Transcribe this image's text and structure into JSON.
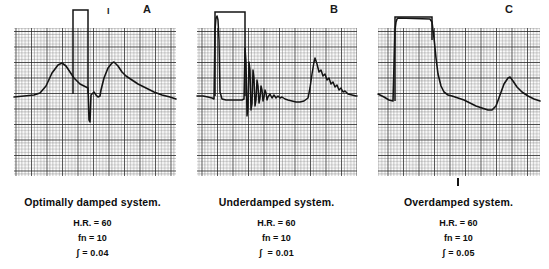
{
  "figure": {
    "background": "#ffffff",
    "ink_color": "#1a1a1a"
  },
  "panels": [
    {
      "letter": "A",
      "tick_label": "I",
      "tick_position": "top",
      "caption": "Optimally damped system.",
      "params": [
        "H.R. = 60",
        "fn = 10",
        "ʃ = 0.04"
      ],
      "param_labels": [
        "H.R.",
        "fn",
        "ʃ"
      ],
      "param_values": [
        "60",
        "10",
        "0.04"
      ],
      "grid": {
        "x": 14,
        "y": 28,
        "width": 162,
        "height": 148,
        "fine_step": 3.1,
        "coarse_step": 15.5,
        "fine_color": "#6e6e6e",
        "coarse_color": "#2b2b2b"
      }
    },
    {
      "letter": "B",
      "tick_label": "",
      "tick_position": "none",
      "caption": "Underdamped system.",
      "params": [
        "H.R. = 60",
        "fn = 10",
        "ʃ  = 0.01"
      ],
      "param_labels": [
        "H.R.",
        "fn",
        "ʃ"
      ],
      "param_values": [
        "60",
        "10",
        "0.01"
      ],
      "grid": {
        "x": 12,
        "y": 28,
        "width": 160,
        "height": 148,
        "fine_step": 3.1,
        "coarse_step": 15.5,
        "fine_color": "#6e6e6e",
        "coarse_color": "#2b2b2b"
      }
    },
    {
      "letter": "C",
      "tick_label": "I",
      "tick_position": "bottom",
      "caption": "Overdamped system.",
      "params": [
        "H.R. = 60",
        "fn = 10",
        "ʃ = 0.05"
      ],
      "param_labels": [
        "H.R.",
        "fn",
        "ʃ"
      ],
      "param_values": [
        "60",
        "10",
        "0.05"
      ],
      "grid": {
        "x": 10,
        "y": 28,
        "width": 162,
        "height": 148,
        "fine_step": 3.1,
        "coarse_step": 15.5,
        "fine_color": "#6e6e6e",
        "coarse_color": "#2b2b2b"
      }
    }
  ],
  "chart_data": {
    "type": "line",
    "xlabel": "",
    "ylabel": "",
    "grid": true,
    "legend": "none",
    "series": [
      {
        "name": "A — Optimally damped system",
        "heart_rate_bpm": 60,
        "natural_frequency_hz": 10,
        "damping_coefficient": 0.04,
        "square_wave": {
          "rise_x": 73,
          "fall_x": 88,
          "top_y": 10,
          "baseline_y": 94
        },
        "trace_points": "14,97 24,96 34,95 40,93 46,86 52,73 58,65 62,63 66,66 70,72 74,78 78,82 80,84 84,86 88,88 89,120 90,122 91,95 94,92 96,95 98,97 100,96 101,90 104,78 108,68 112,63 114,62 118,66 122,72 126,76 132,80 138,84 146,88 154,92 162,95 170,97 176,99"
      },
      {
        "name": "B — Underdamped system",
        "heart_rate_bpm": 60,
        "natural_frequency_hz": 10,
        "damping_coefficient": 0.01,
        "square_wave": {
          "rise_x": 215,
          "fall_x": 245,
          "top_y": 12,
          "baseline_y": 96
        },
        "trace_points": "197,96 203,96 208,97 212,98 214,99 215,30 216,18 217,16 218,20 219,40 220,92 222,99 226,100 230,100 234,100 238,100 242,100 244,99 245,48 246,62 247,116 248,108 249,62 250,70 251,110 252,104 253,70 254,78 255,106 256,100 257,80 258,86 259,103 260,98 261,86 262,90 263,101 264,97 265,90 266,93 267,100 268,97 270,94 272,98 274,95 276,98 278,96 280,98 282,97 285,99 288,100 292,101 296,102 300,102 304,101 308,98 310,88 312,74 314,62 315,58 317,64 319,72 321,70 323,76 325,74 327,80 329,78 331,84 333,82 335,87 337,85 339,90 341,88 343,92 345,91 348,94 352,95 356,96 357,96"
      },
      {
        "name": "C — Overdamped system",
        "heart_rate_bpm": 60,
        "natural_frequency_hz": 10,
        "damping_coefficient": 0.05,
        "square_wave": {
          "rise_x": 395,
          "fall_x": 432,
          "top_y": 17,
          "baseline_y": 101
        },
        "trace_points": "378,94 384,97 389,100 393,101 395,30 396,22 397,19 398,18 430,19 432,22 434,38 436,58 438,74 441,86 444,92 448,95 452,96 458,98 464,100 470,103 476,106 482,108 488,110 492,110 496,106 500,95 504,84 508,78 510,77 513,81 517,87 522,92 528,96 534,99 540,101"
      }
    ]
  },
  "annotations": {
    "tick_a": {
      "label": "I",
      "x": 107,
      "y": 8
    },
    "tick_c": {
      "label": "I",
      "x": 458,
      "y": 177
    },
    "letter_a": {
      "label": "A",
      "x": 143,
      "y": 4
    },
    "letter_b": {
      "label": "B",
      "x": 330,
      "y": 4
    },
    "letter_c": {
      "label": "C",
      "x": 505,
      "y": 4
    }
  }
}
